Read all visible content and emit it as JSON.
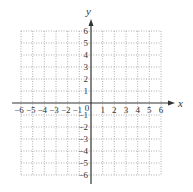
{
  "chart_data": {
    "type": "scatter",
    "title": "",
    "xlabel": "x",
    "ylabel": "y",
    "xlim": [
      -6,
      6
    ],
    "ylim": [
      -6,
      6
    ],
    "grid": true,
    "grid_style": "dotted",
    "x_ticks": [
      "-6",
      "-5",
      "-4",
      "-3",
      "-2",
      "-1",
      "0",
      "1",
      "2",
      "3",
      "4",
      "5",
      "6"
    ],
    "y_ticks": [
      "-6",
      "-5",
      "-4",
      "-3",
      "-2",
      "-1",
      "1",
      "2",
      "3",
      "4",
      "5",
      "6"
    ],
    "origin_label": "0",
    "series": [],
    "colors": {
      "axis": "#333333",
      "grid": "#9a9a9a",
      "background": "#ffffff"
    }
  }
}
